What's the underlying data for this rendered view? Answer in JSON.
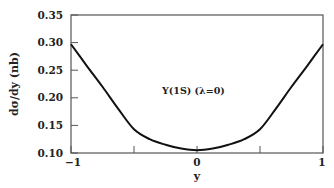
{
  "chart_data": {
    "type": "line",
    "title": "",
    "xlabel": "y",
    "ylabel": "dσ/dy (nb)",
    "xlim": [
      -1,
      1
    ],
    "ylim": [
      0.1,
      0.35
    ],
    "x_ticks": [
      -1,
      0,
      1
    ],
    "x_tick_labels": [
      "−1",
      "0",
      "1"
    ],
    "x_minor_ticks": [
      -0.5,
      0.5
    ],
    "y_ticks": [
      0.1,
      0.15,
      0.2,
      0.25,
      0.3,
      0.35
    ],
    "y_tick_labels": [
      "0.10",
      "0.15",
      "0.20",
      "0.25",
      "0.30",
      "0.35"
    ],
    "grid": false,
    "legend": null,
    "annotations": [
      {
        "text": "Υ(1S) (λ=0)",
        "x": 0.1,
        "y": 0.245
      }
    ],
    "series": [
      {
        "name": "Υ(1S) (λ=0)",
        "color": "#111111",
        "x": [
          -1.0,
          -0.875,
          -0.75,
          -0.625,
          -0.5,
          -0.375,
          -0.25,
          -0.125,
          0.0,
          0.125,
          0.25,
          0.375,
          0.5,
          0.625,
          0.75,
          0.875,
          1.0
        ],
        "values": [
          0.297,
          0.258,
          0.22,
          0.18,
          0.143,
          0.125,
          0.115,
          0.108,
          0.105,
          0.108,
          0.115,
          0.125,
          0.143,
          0.18,
          0.22,
          0.258,
          0.297
        ]
      }
    ]
  }
}
